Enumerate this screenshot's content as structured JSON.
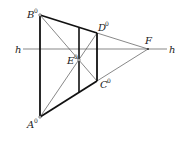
{
  "diagram": {
    "title": "",
    "points": {
      "A": {
        "label": "A",
        "sup": "0",
        "x": 40,
        "y": 117
      },
      "B": {
        "label": "B",
        "sup": "0",
        "x": 40,
        "y": 15
      },
      "C": {
        "label": "C",
        "sup": "0",
        "x": 97,
        "y": 81
      },
      "D": {
        "label": "D",
        "sup": "0",
        "x": 97,
        "y": 33
      },
      "E": {
        "label": "E",
        "sup": "0",
        "x": 79,
        "y": 60
      },
      "F": {
        "label": "F",
        "sup": "",
        "x": 148,
        "y": 49
      }
    },
    "horizon": {
      "label_left": "h",
      "label_right": "h",
      "y": 49,
      "x1": 23,
      "x2": 167
    },
    "middle_vertical": {
      "x": 79,
      "y1": 27,
      "y2": 92
    },
    "colors": {
      "thick": "#111111",
      "thin": "#555555"
    }
  }
}
